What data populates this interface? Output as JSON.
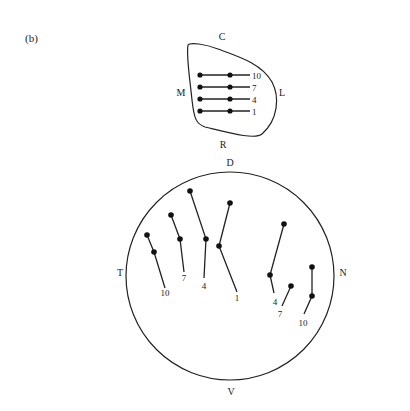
{
  "panel_label": "(b)",
  "retina": {
    "labels": {
      "top": "C",
      "left": "M",
      "right": "L",
      "bottom": "R"
    },
    "rows": [
      {
        "label": "10",
        "y": 75
      },
      {
        "label": "7",
        "y": 87
      },
      {
        "label": "4",
        "y": 99
      },
      {
        "label": "1",
        "y": 111
      }
    ]
  },
  "tectum": {
    "labels": {
      "top": "D",
      "left": "T",
      "right": "N",
      "bottom": "V"
    },
    "left_tracks": [
      {
        "label": "10",
        "dots": [
          [
            147,
            235
          ],
          [
            154,
            252
          ]
        ],
        "end": [
          165,
          288
        ],
        "label_pos": [
          165,
          296
        ]
      },
      {
        "label": "7",
        "dots": [
          [
            171,
            215
          ],
          [
            180,
            239
          ]
        ],
        "end": [
          184,
          272
        ],
        "label_pos": [
          184,
          281
        ]
      },
      {
        "label": "4",
        "dots": [
          [
            190,
            191
          ],
          [
            206,
            239
          ]
        ],
        "end": [
          204,
          278
        ],
        "label_pos": [
          204,
          289
        ]
      },
      {
        "label": "1",
        "dots": [
          [
            230,
            203
          ],
          [
            219,
            246
          ]
        ],
        "end": [
          237,
          292
        ],
        "label_pos": [
          237,
          301
        ]
      }
    ],
    "right_tracks": [
      {
        "label": "4",
        "dots": [
          [
            284,
            224
          ],
          [
            270,
            275
          ]
        ],
        "end": [
          274,
          293
        ],
        "label_pos": [
          275,
          305
        ]
      },
      {
        "label": "7",
        "dots": [
          [
            291,
            286
          ]
        ],
        "end": [
          282,
          306
        ],
        "label_pos": [
          280,
          317
        ]
      },
      {
        "label": "10",
        "dots": [
          [
            312,
            267
          ],
          [
            312,
            296
          ]
        ],
        "end": [
          304,
          314
        ],
        "label_pos": [
          303,
          326
        ]
      }
    ]
  }
}
